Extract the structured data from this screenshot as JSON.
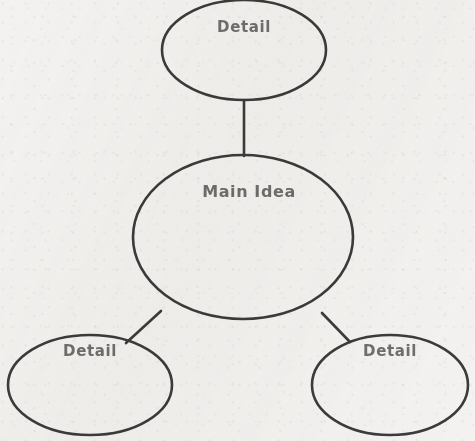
{
  "document": {
    "title": "Main Idea and Details Concept Map",
    "background_color": "#f3f2f0",
    "stroke_color": "#3b3b3b",
    "text_color": "#6e6e6e",
    "width": 475,
    "height": 441
  },
  "nodes": {
    "center": {
      "label": "Main Idea",
      "cx": 243,
      "cy": 237,
      "rx": 110,
      "ry": 82,
      "label_x": 249,
      "label_y": 192
    },
    "top": {
      "label": "Detail",
      "cx": 244,
      "cy": 50,
      "rx": 82,
      "ry": 50,
      "label_x": 244,
      "label_y": 27
    },
    "bottom_left": {
      "label": "Detail",
      "cx": 90,
      "cy": 385,
      "rx": 82,
      "ry": 50,
      "label_x": 90,
      "label_y": 351
    },
    "bottom_right": {
      "label": "Detail",
      "cx": 390,
      "cy": 385,
      "rx": 78,
      "ry": 50,
      "label_x": 390,
      "label_y": 351
    }
  },
  "connectors": [
    {
      "name": "center-to-top",
      "x1": 244,
      "y1": 100,
      "x2": 244,
      "y2": 156
    },
    {
      "name": "center-to-bottom-left",
      "x1": 161,
      "y1": 311,
      "x2": 126,
      "y2": 343
    },
    {
      "name": "center-to-bottom-right",
      "x1": 322,
      "y1": 313,
      "x2": 350,
      "y2": 342
    }
  ]
}
